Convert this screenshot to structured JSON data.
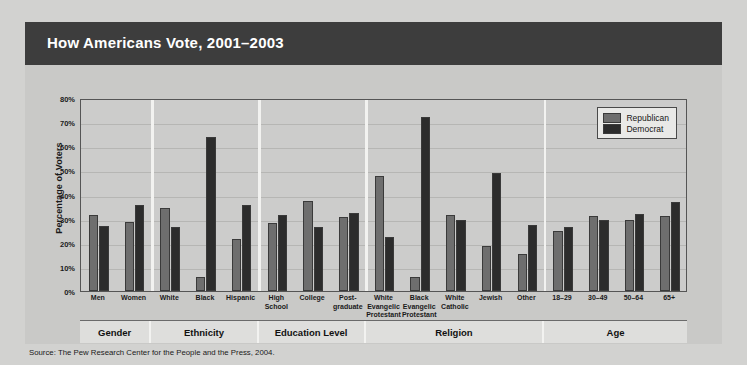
{
  "title": "How Americans Vote, 2001–2003",
  "source": "Source: The Pew Research Center for the People and the Press, 2004.",
  "legend": {
    "republican_label": "Republican",
    "democrat_label": "Democrat",
    "republican_color": "#6e6e6e",
    "democrat_color": "#2c2c2c"
  },
  "axis": {
    "y_title": "Percentage of Voters",
    "y_ticks": [
      "80%",
      "70%",
      "60%",
      "50%",
      "40%",
      "30%",
      "20%",
      "10%",
      "0%"
    ]
  },
  "groups": [
    {
      "name": "Gender",
      "count": 2
    },
    {
      "name": "Ethnicity",
      "count": 3
    },
    {
      "name": "Education Level",
      "count": 3
    },
    {
      "name": "Religion",
      "count": 5
    },
    {
      "name": "Age",
      "count": 4
    }
  ],
  "chart_data": {
    "type": "bar",
    "title": "How Americans Vote, 2001–2003",
    "xlabel": "",
    "ylabel": "Percentage of Voters",
    "ylim": [
      0,
      80
    ],
    "ytick_step": 10,
    "grid": true,
    "legend_position": "top-right",
    "categories": [
      "Men",
      "Women",
      "White",
      "Black",
      "Hispanic",
      "High School",
      "College",
      "Post-graduate",
      "White Evangelical Protestant",
      "Black Evangelical Protestant",
      "White Catholic",
      "Jewish",
      "Other",
      "18–29",
      "30–49",
      "50–64",
      "65+"
    ],
    "category_label_lines": [
      [
        "Men"
      ],
      [
        "Women"
      ],
      [
        "White"
      ],
      [
        "Black"
      ],
      [
        "Hispanic"
      ],
      [
        "High",
        "School"
      ],
      [
        "College"
      ],
      [
        "Post-",
        "graduate"
      ],
      [
        "White",
        "Evangelic",
        "Protestant"
      ],
      [
        "Black",
        "Evangelic",
        "Protestant"
      ],
      [
        "White",
        "Catholic"
      ],
      [
        "Jewish"
      ],
      [
        "Other"
      ],
      [
        "18–29"
      ],
      [
        "30–49"
      ],
      [
        "50–64"
      ],
      [
        "65+"
      ]
    ],
    "group_labels": [
      "Gender",
      "Ethnicity",
      "Education Level",
      "Religion",
      "Age"
    ],
    "group_sizes": [
      2,
      3,
      3,
      5,
      4
    ],
    "series": [
      {
        "name": "Republican",
        "color": "#6e6e6e",
        "values": [
          31.5,
          28.5,
          34.5,
          6,
          21.5,
          28,
          37.5,
          30.5,
          47.5,
          6,
          31.5,
          18.5,
          15.5,
          25,
          31,
          29.5,
          31
        ]
      },
      {
        "name": "Democrat",
        "color": "#2c2c2c",
        "values": [
          27,
          35.5,
          26.5,
          64,
          35.5,
          31.5,
          26.5,
          32.5,
          22.5,
          72,
          29.5,
          49,
          27.5,
          26.5,
          29.5,
          32,
          37
        ]
      }
    ],
    "annotations": [
      "Source: The Pew Research Center for the People and the Press, 2004."
    ]
  }
}
